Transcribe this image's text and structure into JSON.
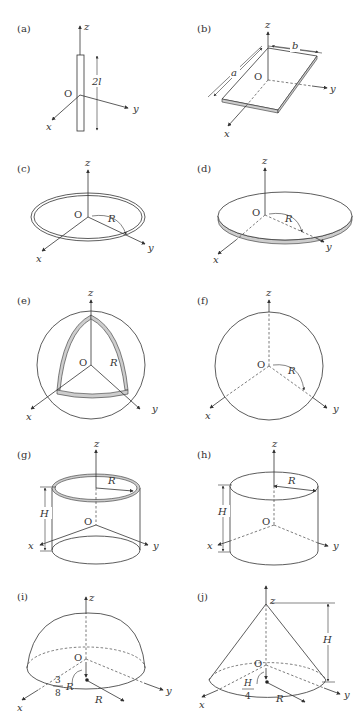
{
  "panels": [
    {
      "id": "a",
      "label": "(a)",
      "description": "Thin rod of length 2l along z-axis",
      "dims": [
        "2l"
      ],
      "axes": {
        "x": "x",
        "y": "y",
        "z": "z",
        "origin": "O"
      }
    },
    {
      "id": "b",
      "label": "(b)",
      "description": "Thin rectangular plate with sides a and b",
      "dims": [
        "a",
        "b"
      ],
      "axes": {
        "x": "x",
        "y": "y",
        "z": "z",
        "origin": "O"
      }
    },
    {
      "id": "c",
      "label": "(c)",
      "description": "Thin ring of radius R",
      "dims": [
        "R"
      ],
      "axes": {
        "x": "x",
        "y": "y",
        "z": "z",
        "origin": "O"
      }
    },
    {
      "id": "d",
      "label": "(d)",
      "description": "Thin disk of radius R",
      "dims": [
        "R"
      ],
      "axes": {
        "x": "x",
        "y": "y",
        "z": "z",
        "origin": "O"
      }
    },
    {
      "id": "e",
      "label": "(e)",
      "description": "Thin spherical shell of radius R",
      "dims": [
        "R"
      ],
      "axes": {
        "x": "x",
        "y": "y",
        "z": "z",
        "origin": "O"
      }
    },
    {
      "id": "f",
      "label": "(f)",
      "description": "Solid sphere of radius R",
      "dims": [
        "R"
      ],
      "axes": {
        "x": "x",
        "y": "y",
        "z": "z",
        "origin": "O"
      }
    },
    {
      "id": "g",
      "label": "(g)",
      "description": "Thin cylindrical shell of radius R and height H",
      "dims": [
        "R",
        "H"
      ],
      "axes": {
        "x": "x",
        "y": "y",
        "z": "z",
        "origin": "O"
      }
    },
    {
      "id": "h",
      "label": "(h)",
      "description": "Solid cylinder of radius R and height H",
      "dims": [
        "R",
        "H"
      ],
      "axes": {
        "x": "x",
        "y": "y",
        "z": "z",
        "origin": "O"
      }
    },
    {
      "id": "i",
      "label": "(i)",
      "description": "Solid hemisphere of radius R, center of mass at 3/8 R",
      "dims": [
        "R",
        "3/8 R"
      ],
      "frac": {
        "num": "3",
        "den": "8",
        "var": "R"
      },
      "axes": {
        "x": "x",
        "y": "y",
        "z": "z",
        "origin": "O"
      }
    },
    {
      "id": "j",
      "label": "(j)",
      "description": "Solid cone of radius R and height H, center of mass at H/4",
      "dims": [
        "R",
        "H",
        "H/4"
      ],
      "frac": {
        "num": "H",
        "den": "4"
      },
      "axes": {
        "x": "x",
        "y": "y",
        "z": "z",
        "origin": "O"
      }
    }
  ]
}
